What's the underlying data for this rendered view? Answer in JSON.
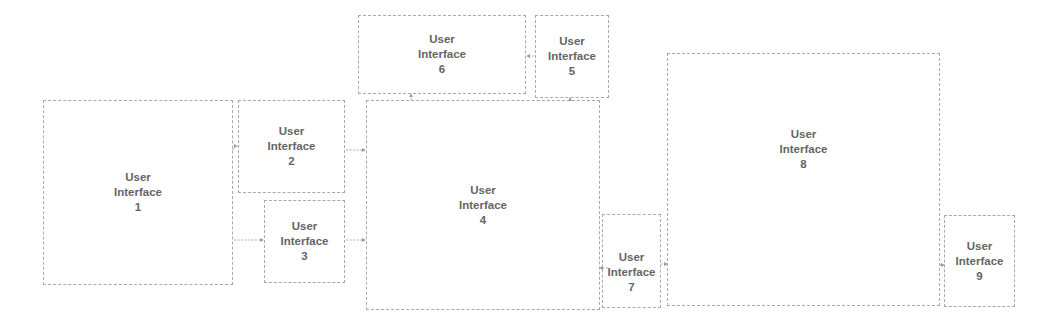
{
  "diagram": {
    "boxes": [
      {
        "id": 1,
        "line1": "User",
        "line2": "Interface",
        "number": "1"
      },
      {
        "id": 2,
        "line1": "User",
        "line2": "Interface",
        "number": "2"
      },
      {
        "id": 3,
        "line1": "User",
        "line2": "Interface",
        "number": "3"
      },
      {
        "id": 4,
        "line1": "User",
        "line2": "Interface",
        "number": "4"
      },
      {
        "id": 5,
        "line1": "User",
        "line2": "Interface",
        "number": "5"
      },
      {
        "id": 6,
        "line1": "User",
        "line2": "Interface",
        "number": "6"
      },
      {
        "id": 7,
        "line1": "User",
        "line2": "Interface",
        "number": "7"
      },
      {
        "id": 8,
        "line1": "User",
        "line2": "Interface",
        "number": "8"
      },
      {
        "id": 9,
        "line1": "User",
        "line2": "Interface",
        "number": "9"
      }
    ],
    "connections": [
      {
        "from": 1,
        "to": 2
      },
      {
        "from": 1,
        "to": 3
      },
      {
        "from": 2,
        "to": 4
      },
      {
        "from": 3,
        "to": 4
      },
      {
        "from": 4,
        "to": 6
      },
      {
        "from": 4,
        "to": 5
      },
      {
        "from": 5,
        "to": 6
      },
      {
        "from": 7,
        "to": 4
      },
      {
        "from": 7,
        "to": 8
      },
      {
        "from": 8,
        "to": 9
      }
    ],
    "colors": {
      "border": "#a9a9a9",
      "text": "#4a4a4a",
      "arrow": "#9a9a9a"
    }
  }
}
